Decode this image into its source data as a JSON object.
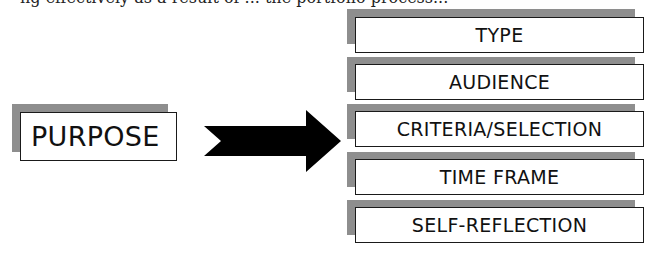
{
  "header_fragment": "ng effectively as a result of ... the portfolio process...",
  "source": {
    "label": "PURPOSE"
  },
  "arrow": {
    "direction": "right",
    "color": "#000000"
  },
  "targets": [
    {
      "label": "TYPE"
    },
    {
      "label": "AUDIENCE"
    },
    {
      "label": "CRITERIA/SELECTION"
    },
    {
      "label": "TIME FRAME"
    },
    {
      "label": "SELF-REFLECTION"
    }
  ],
  "colors": {
    "shadow": "#8e8e8e",
    "border": "#1a1a1a",
    "text": "#111111"
  }
}
